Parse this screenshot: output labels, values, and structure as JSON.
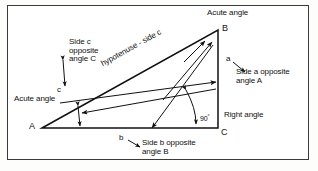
{
  "figure": {
    "type": "right-triangle-annotated-diagram",
    "stroke_color": "#111111",
    "background_color": "#ffffff",
    "frame_color": "#3a3a3a"
  },
  "vertices": {
    "a": {
      "label": "A",
      "x": 42,
      "y": 128,
      "note": "lower left, acute angle"
    },
    "b": {
      "label": "B",
      "x": 218,
      "y": 30,
      "note": "upper right, acute angle"
    },
    "c": {
      "label": "C",
      "x": 218,
      "y": 128,
      "note": "lower right, right angle"
    }
  },
  "side_markers": {
    "a": "a",
    "b": "b",
    "c": "c"
  },
  "labels": {
    "acute_angle_top": "Acute angle",
    "acute_angle_left": "Acute angle",
    "right_angle": "Right angle",
    "angle_value": "90",
    "degree_symbol": "°",
    "hypotenuse": "hypotenuse - side c",
    "side_c_text": "Side c\nopposite\nangle C",
    "side_a_text": "Side a opposite\nangle A",
    "side_b_text": "Side b opposite\nangle B"
  }
}
